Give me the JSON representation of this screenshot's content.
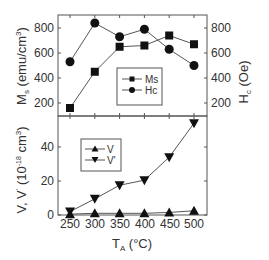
{
  "chart_data": [
    {
      "type": "line",
      "panel": "top",
      "x": [
        250,
        300,
        350,
        400,
        450,
        500
      ],
      "series": [
        {
          "name": "Ms",
          "marker": "square",
          "axis": "left",
          "values": [
            160,
            450,
            650,
            660,
            740,
            670
          ]
        },
        {
          "name": "Hc",
          "marker": "circle",
          "axis": "right",
          "values": [
            530,
            840,
            730,
            790,
            630,
            500
          ]
        }
      ],
      "ylabel_left": "Ms (emu/cm3)",
      "ylabel_right": "Hc (Oe)",
      "yticks_left": [
        200,
        400,
        600,
        800
      ],
      "yticks_right": [
        200,
        400,
        600,
        800
      ],
      "ylim": [
        100,
        900
      ],
      "legend": [
        "Ms",
        "Hc"
      ],
      "legend_position": "lower right inside"
    },
    {
      "type": "line",
      "panel": "bottom",
      "x": [
        250,
        300,
        350,
        400,
        450,
        500
      ],
      "series": [
        {
          "name": "V",
          "marker": "triangle-up",
          "values": [
            0.5,
            1,
            1,
            1,
            1.5,
            2.5
          ]
        },
        {
          "name": "V'",
          "marker": "triangle-down",
          "values": [
            2,
            9.5,
            17.5,
            20.5,
            34,
            54
          ]
        }
      ],
      "ylabel": "V, V' (10^-18 cm3)",
      "yticks": [
        0,
        20,
        40
      ],
      "ylim": [
        0,
        59
      ],
      "xlabel": "TA (°C)",
      "xticks": [
        250,
        300,
        350,
        400,
        450,
        500
      ],
      "legend": [
        "V",
        "V'"
      ],
      "legend_position": "upper left inside"
    }
  ],
  "labels": {
    "top_ylabel_left_main": "M",
    "top_ylabel_left_sub": "s",
    "top_ylabel_left_rest": " (emu/cm",
    "top_ylabel_left_sup": "3",
    "top_ylabel_left_end": ")",
    "top_ylabel_right_main": "H",
    "top_ylabel_right_sub": "c",
    "top_ylabel_right_rest": " (Oe)",
    "bottom_ylabel": "V, V",
    "bottom_ylabel_prime": "'",
    "bottom_ylabel_mid": " (10",
    "bottom_ylabel_exp": "-18",
    "bottom_ylabel_unit": " cm",
    "bottom_ylabel_sup": "3",
    "bottom_ylabel_end": ")",
    "xlabel_main": "T",
    "xlabel_sub": "A",
    "xlabel_rest": " (°C)",
    "legend_top": [
      "Ms",
      "Hc"
    ],
    "legend_bottom": [
      "V",
      "V'"
    ],
    "xticks": [
      "250",
      "300",
      "350",
      "400",
      "450",
      "500"
    ],
    "yticks_top": [
      "800",
      "600",
      "400",
      "200"
    ],
    "yticks_top_right": [
      "800",
      "600",
      "400",
      "200"
    ],
    "yticks_bottom": [
      "40",
      "20",
      "0"
    ]
  }
}
